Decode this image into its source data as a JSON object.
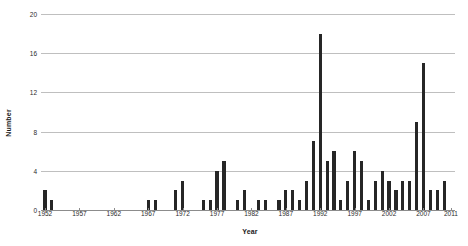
{
  "chart_data": {
    "type": "bar",
    "title": "",
    "xlabel": "Year",
    "ylabel": "Number",
    "ylim": [
      0,
      20
    ],
    "yticks": [
      0,
      4,
      8,
      12,
      16,
      20
    ],
    "grid": true,
    "legend": null,
    "xtick_labels": [
      "1952",
      "1957",
      "1962",
      "1967",
      "1972",
      "1977",
      "1982",
      "1987",
      "1992",
      "1997",
      "2002",
      "2007",
      "2011"
    ],
    "xlim": [
      1952,
      2011
    ],
    "bar_color": "#262626",
    "gridline_color": "#bfbfbf",
    "categories": [
      "1952",
      "1953",
      "1954",
      "1955",
      "1956",
      "1957",
      "1958",
      "1959",
      "1960",
      "1961",
      "1962",
      "1963",
      "1964",
      "1965",
      "1966",
      "1967",
      "1968",
      "1969",
      "1970",
      "1971",
      "1972",
      "1973",
      "1974",
      "1975",
      "1976",
      "1977",
      "1978",
      "1979",
      "1980",
      "1981",
      "1982",
      "1983",
      "1984",
      "1985",
      "1986",
      "1987",
      "1988",
      "1989",
      "1990",
      "1991",
      "1992",
      "1993",
      "1994",
      "1995",
      "1996",
      "1997",
      "1998",
      "1999",
      "2000",
      "2001",
      "2002",
      "2003",
      "2004",
      "2005",
      "2006",
      "2007",
      "2008",
      "2009",
      "2010",
      "2011"
    ],
    "values": [
      2,
      1,
      0,
      0,
      0,
      0,
      0,
      0,
      0,
      0,
      0,
      0,
      0,
      0,
      0,
      1,
      1,
      0,
      0,
      2,
      3,
      0,
      0,
      1,
      1,
      4,
      5,
      0,
      1,
      2,
      0,
      1,
      1,
      0,
      1,
      2,
      2,
      1,
      3,
      7,
      18,
      5,
      6,
      1,
      3,
      6,
      5,
      1,
      3,
      4,
      3,
      2,
      3,
      3,
      9,
      15,
      2,
      2,
      3,
      0
    ]
  },
  "axis": {
    "ylabel": "Number",
    "xlabel": "Year"
  }
}
